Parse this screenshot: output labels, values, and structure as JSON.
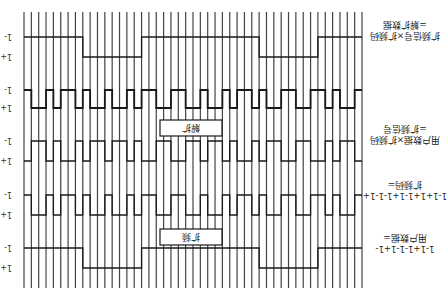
{
  "diagram": {
    "title": "",
    "orientation": "rotated-180",
    "grid": {
      "x_start": 24,
      "x_end": 362,
      "count": 47,
      "y_top": 12,
      "y_bottom": 288
    },
    "rows": [
      {
        "id": "despread-data",
        "label_line1": "扩频信号×扩频码",
        "label_line2": "=解扩数据",
        "level_minus": "1-",
        "level_plus": "1+",
        "y_minus": 37,
        "y_plus": 57,
        "bits": [
          -1,
          -1,
          -1,
          -1,
          -1,
          -1,
          -1,
          -1,
          1,
          1,
          1,
          1,
          1,
          1,
          1,
          1,
          -1,
          -1,
          -1,
          -1,
          -1,
          -1,
          -1,
          -1,
          -1,
          -1,
          -1,
          -1,
          -1,
          -1,
          -1,
          -1,
          1,
          1,
          1,
          1,
          1,
          1,
          1,
          1,
          -1,
          -1,
          -1,
          -1,
          -1,
          -1
        ]
      },
      {
        "id": "spread-signal-rx",
        "label_line1": "",
        "label_line2": "",
        "level_minus": "1-",
        "level_plus": "1+",
        "y_minus": 90,
        "y_plus": 108,
        "bits": [
          -1,
          1,
          1,
          -1,
          1,
          -1,
          -1,
          1,
          -1,
          1,
          1,
          -1,
          1,
          1,
          -1,
          1,
          -1,
          -1,
          1,
          1,
          -1,
          -1,
          1,
          1,
          -1,
          1,
          1,
          -1,
          1,
          -1,
          -1,
          1,
          -1,
          1,
          1,
          -1,
          -1,
          1,
          1,
          -1,
          -1,
          1,
          -1,
          1,
          1,
          -1
        ]
      },
      {
        "id": "spread-signal",
        "label_line1": "用户数据×扩频码",
        "label_line2": "=扩频信号",
        "level_minus": "1-",
        "level_plus": "1+",
        "y_minus": 141,
        "y_plus": 161,
        "bits": [
          1,
          -1,
          -1,
          1,
          -1,
          1,
          1,
          -1,
          1,
          -1,
          -1,
          1,
          -1,
          -1,
          1,
          -1,
          1,
          1,
          -1,
          -1,
          1,
          1,
          -1,
          -1,
          1,
          -1,
          -1,
          1,
          -1,
          1,
          1,
          -1,
          1,
          -1,
          -1,
          1,
          1,
          -1,
          -1,
          1,
          1,
          -1,
          1,
          -1,
          -1,
          1
        ]
      },
      {
        "id": "spread-code",
        "label_line1": "1-1+1+1-1+1-1-1+",
        "label_line2": "扩频码=",
        "level_minus": "1-",
        "level_plus": "1+",
        "y_minus": 195,
        "y_plus": 215,
        "bits": [
          -1,
          1,
          1,
          -1,
          1,
          -1,
          -1,
          1,
          -1,
          1,
          1,
          -1,
          1,
          1,
          -1,
          1,
          -1,
          -1,
          1,
          1,
          -1,
          -1,
          1,
          1,
          -1,
          1,
          1,
          -1,
          1,
          -1,
          -1,
          1,
          -1,
          1,
          1,
          -1,
          -1,
          1,
          1,
          -1,
          -1,
          1,
          -1,
          1,
          1,
          -1
        ]
      },
      {
        "id": "user-data",
        "label_line1": "1-1+1-1-1+1-",
        "label_line2": "用户数据=",
        "level_minus": "1-",
        "level_plus": "1+",
        "y_minus": 248,
        "y_plus": 268,
        "bits": [
          -1,
          -1,
          -1,
          -1,
          -1,
          -1,
          -1,
          -1,
          1,
          1,
          1,
          1,
          1,
          1,
          1,
          1,
          -1,
          -1,
          -1,
          -1,
          -1,
          -1,
          -1,
          -1,
          -1,
          -1,
          -1,
          -1,
          -1,
          -1,
          -1,
          -1,
          1,
          1,
          1,
          1,
          1,
          1,
          1,
          1,
          -1,
          -1,
          -1,
          -1,
          -1,
          -1
        ]
      }
    ],
    "boxes": [
      {
        "id": "despread-box",
        "label": "解扩",
        "x": 160,
        "y": 120,
        "w": 62,
        "h": 16
      },
      {
        "id": "spread-box",
        "label": "扩频",
        "x": 160,
        "y": 229,
        "w": 62,
        "h": 16
      }
    ],
    "colors": {
      "line": "#1a1a1a",
      "grid": "#444444",
      "background": "#ffffff"
    }
  }
}
